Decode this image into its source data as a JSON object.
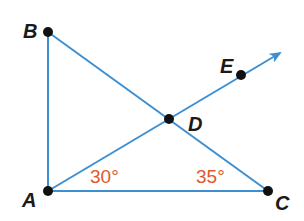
{
  "diagram": {
    "type": "geometry",
    "colors": {
      "line": "#3d8fd1",
      "point": "#111111",
      "angle_label": "#e0582a",
      "text": "#1a1a1a"
    },
    "points": [
      {
        "id": "A",
        "label": "A",
        "x": 48,
        "y": 191
      },
      {
        "id": "B",
        "label": "B",
        "x": 48,
        "y": 32
      },
      {
        "id": "C",
        "label": "C",
        "x": 268,
        "y": 191
      },
      {
        "id": "D",
        "label": "D",
        "x": 169,
        "y": 119
      },
      {
        "id": "E",
        "label": "E",
        "x": 241,
        "y": 75
      }
    ],
    "segments": [
      "AB",
      "AC",
      "BC"
    ],
    "rays": [
      "ADE"
    ],
    "angles": [
      {
        "vertex": "A",
        "label": "30°"
      },
      {
        "vertex": "C",
        "label": "35°"
      }
    ]
  }
}
